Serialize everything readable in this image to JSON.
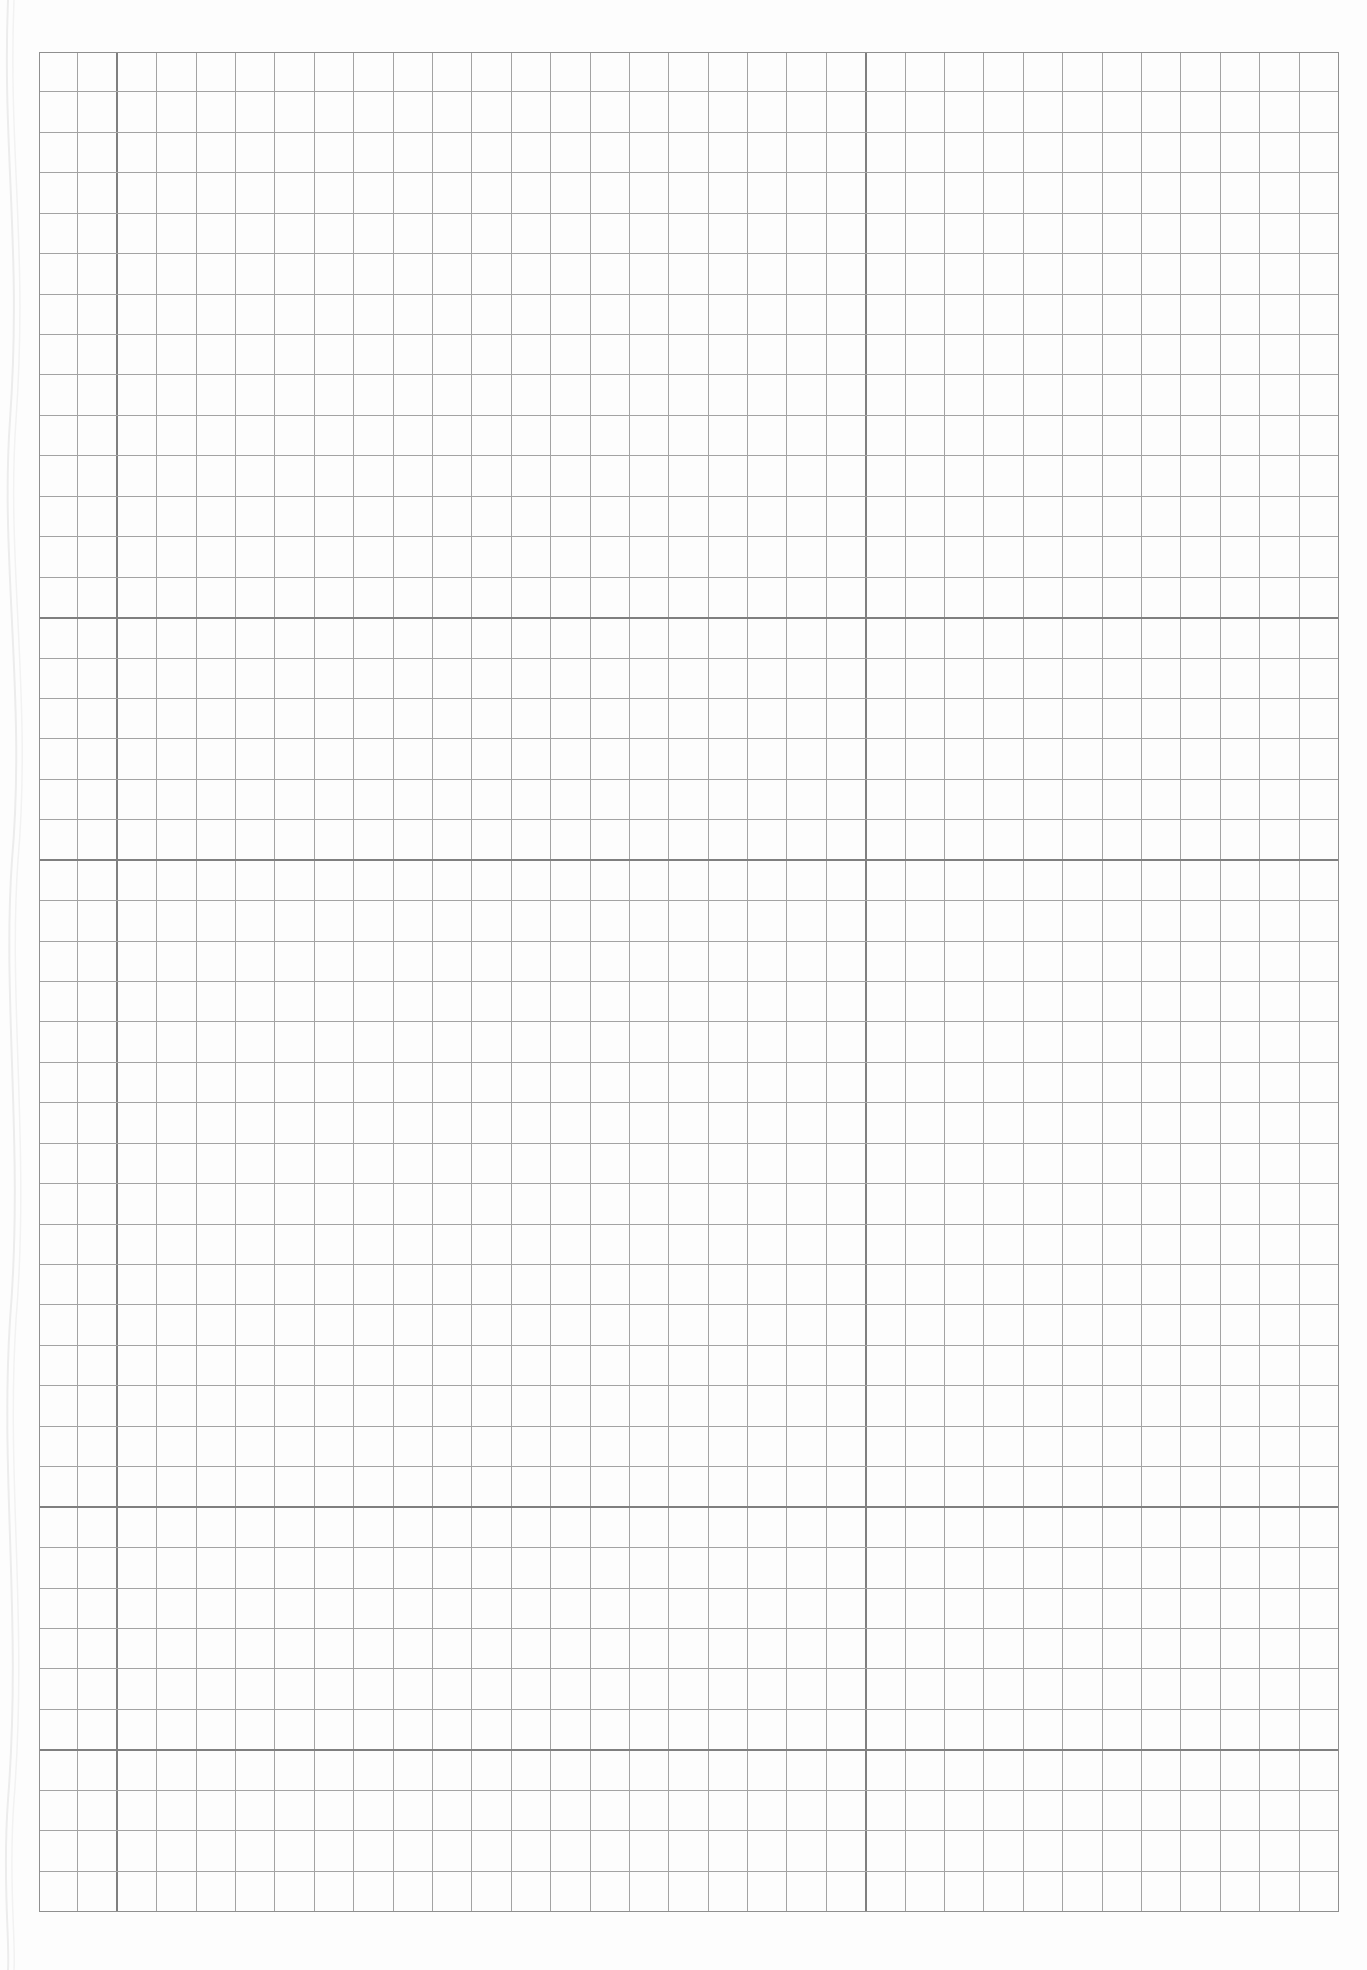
{
  "sheet": {
    "type": "graph-paper",
    "background_color": "#fdfdfd",
    "thin_line_color": "#a3a3a3",
    "thick_line_color": "#7f7f7f",
    "border_color": "#8f8f8f",
    "grid": {
      "left": 39,
      "top": 52,
      "width": 1300,
      "height": 1860,
      "columns": 33,
      "rows": 46,
      "thick_columns": [
        2,
        21
      ],
      "thick_rows": [
        14,
        20,
        36,
        42
      ]
    }
  }
}
